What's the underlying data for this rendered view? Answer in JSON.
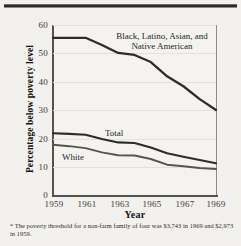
{
  "chart_data": {
    "type": "line",
    "title": "",
    "xlabel": "Year",
    "ylabel": "Percentage below poverty level",
    "xlim": [
      1959,
      1969
    ],
    "ylim": [
      0,
      60
    ],
    "grid": true,
    "legend_position": "inline-labels",
    "xticks": [
      "1959",
      "1961",
      "1963",
      "1965",
      "1967",
      "1969"
    ],
    "yticks": [
      "0",
      "10",
      "20",
      "30",
      "40",
      "50",
      "60"
    ],
    "x": [
      1959,
      1960,
      1961,
      1962,
      1963,
      1964,
      1965,
      1966,
      1967,
      1968,
      1969
    ],
    "series": [
      {
        "name": "Black, Latino, Asian, and Native American",
        "label": "Black, Latino, Asian, and\nNative American",
        "label_line1": "Black, Latino, Asian, and",
        "label_line2": "Native American",
        "color": "#2e2c29",
        "values": [
          55.5,
          55.5,
          55.5,
          53.0,
          50.2,
          49.5,
          47.0,
          42.0,
          38.5,
          34.0,
          30.2
        ]
      },
      {
        "name": "Total",
        "label": "Total",
        "color": "#2e2c29",
        "values": [
          22.0,
          21.8,
          21.5,
          20.0,
          18.8,
          18.6,
          17.0,
          15.0,
          13.8,
          12.6,
          11.5
        ]
      },
      {
        "name": "White",
        "label": "White",
        "color": "#585550",
        "values": [
          18.0,
          17.5,
          16.8,
          15.3,
          14.3,
          14.2,
          13.0,
          11.0,
          10.4,
          9.8,
          9.5
        ]
      }
    ],
    "footnote": "* The poverty threshold for a non-farm family of four was $3,743 in 1969 and $2,973 in 1959."
  }
}
